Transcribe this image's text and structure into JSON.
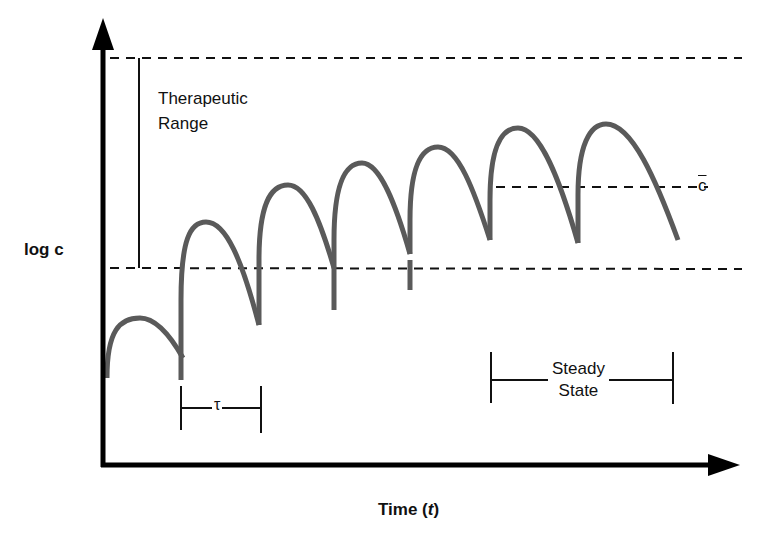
{
  "diagram": {
    "title": "",
    "y_axis_label": "log c",
    "x_axis_label_prefix": "Time (",
    "x_axis_label_var": "t",
    "x_axis_label_suffix": ")",
    "therapeutic_range_line1": "Therapeutic",
    "therapeutic_range_line2": "Range",
    "mean_concentration_label": "c",
    "dosing_interval_label": "τ",
    "steady_state_line1": "Steady",
    "steady_state_line2": "State",
    "colors": {
      "axis": "#000000",
      "curve": "#5a5a5a",
      "dashed_lines": "#111111",
      "background": "#ffffff"
    },
    "reference_lines": [
      {
        "name": "upper-therapeutic-limit",
        "y_px": 58
      },
      {
        "name": "lower-therapeutic-limit",
        "y_px": 268
      },
      {
        "name": "mean-steady-state-concentration",
        "y_px": 187
      }
    ],
    "dose_peaks_px": [
      {
        "dose": 1,
        "x_start": 107,
        "peak_y": 318,
        "trough_y": 358
      },
      {
        "dose": 2,
        "x_start": 181,
        "peak_y": 222,
        "trough_y": 322
      },
      {
        "dose": 3,
        "x_start": 260,
        "peak_y": 185,
        "trough_y": 292
      },
      {
        "dose": 4,
        "x_start": 335,
        "peak_y": 163,
        "trough_y": 254
      },
      {
        "dose": 5,
        "x_start": 411,
        "peak_y": 147,
        "trough_y": 238
      },
      {
        "dose": 6,
        "x_start": 491,
        "peak_y": 128,
        "trough_y": 243
      },
      {
        "dose": 7,
        "x_start": 580,
        "peak_y": 124,
        "trough_y": 238
      }
    ]
  }
}
